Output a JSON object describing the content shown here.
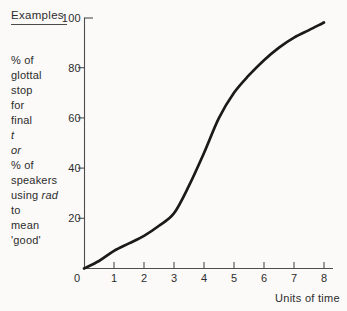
{
  "figure": {
    "examples_heading": "Examples",
    "left_text_lines": [
      [
        {
          "t": "% of",
          "i": false
        }
      ],
      [
        {
          "t": "glottal",
          "i": false
        }
      ],
      [
        {
          "t": "stop",
          "i": false
        }
      ],
      [
        {
          "t": "for",
          "i": false
        }
      ],
      [
        {
          "t": "final",
          "i": false
        }
      ],
      [
        {
          "t": "t",
          "i": true
        }
      ],
      [
        {
          "t": "or",
          "i": true
        }
      ],
      [
        {
          "t": "% of",
          "i": false
        }
      ],
      [
        {
          "t": "speakers",
          "i": false
        }
      ],
      [
        {
          "t": "using ",
          "i": false
        },
        {
          "t": "rad",
          "i": true
        }
      ],
      [
        {
          "t": "to",
          "i": false
        }
      ],
      [
        {
          "t": "mean",
          "i": false
        }
      ],
      [
        {
          "t": "'good'",
          "i": false
        }
      ]
    ]
  },
  "chart_data": {
    "type": "line",
    "title": "",
    "xlabel": "Units of time",
    "ylabel": "% of glottal stop for final t  or  % of speakers using rad to mean 'good'",
    "x": [
      0,
      0.5,
      1,
      1.5,
      2,
      2.5,
      3,
      3.5,
      4,
      4.5,
      5,
      5.5,
      6,
      6.5,
      7,
      7.5,
      8
    ],
    "y": [
      0,
      3,
      7,
      10,
      13,
      17,
      22,
      33,
      46,
      60,
      70,
      77,
      83,
      88,
      92,
      95,
      98
    ],
    "x_ticks": [
      0,
      1,
      2,
      3,
      4,
      5,
      6,
      7,
      8
    ],
    "y_ticks": [
      20,
      40,
      60,
      80,
      100
    ],
    "xlim": [
      0,
      8
    ],
    "ylim": [
      0,
      100
    ],
    "grid": false,
    "legend": null,
    "curve_color": "#1a1a1a",
    "axis_color": "#4d4d4d",
    "background_color": "#fbfaf8"
  }
}
